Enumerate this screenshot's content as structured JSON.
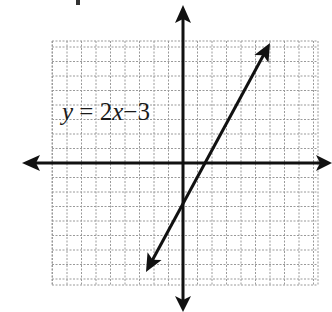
{
  "figure": {
    "type": "coordinate-plane-graph",
    "equation_label": {
      "var_y": "y",
      "equals": "=",
      "coef": "2",
      "var_x": "x",
      "op": "−",
      "const": "3"
    },
    "equation_text": "y = 2x − 3",
    "grid": {
      "left": 52,
      "top": 41,
      "right": 318,
      "bottom": 285,
      "origin_x": 183,
      "origin_y": 163,
      "unit_px": 14.5,
      "color": "#9a9a9a"
    },
    "axes": {
      "x_axis": {
        "y": 163,
        "x_start": 22,
        "x_end": 332
      },
      "y_axis": {
        "x": 183,
        "y_start": 5,
        "y_end": 312
      },
      "color": "#111111"
    },
    "line": {
      "slope": 2,
      "intercept": -3,
      "x1": 146,
      "y1": 272,
      "x2": 270,
      "y2": 43,
      "color": "#111111"
    }
  }
}
